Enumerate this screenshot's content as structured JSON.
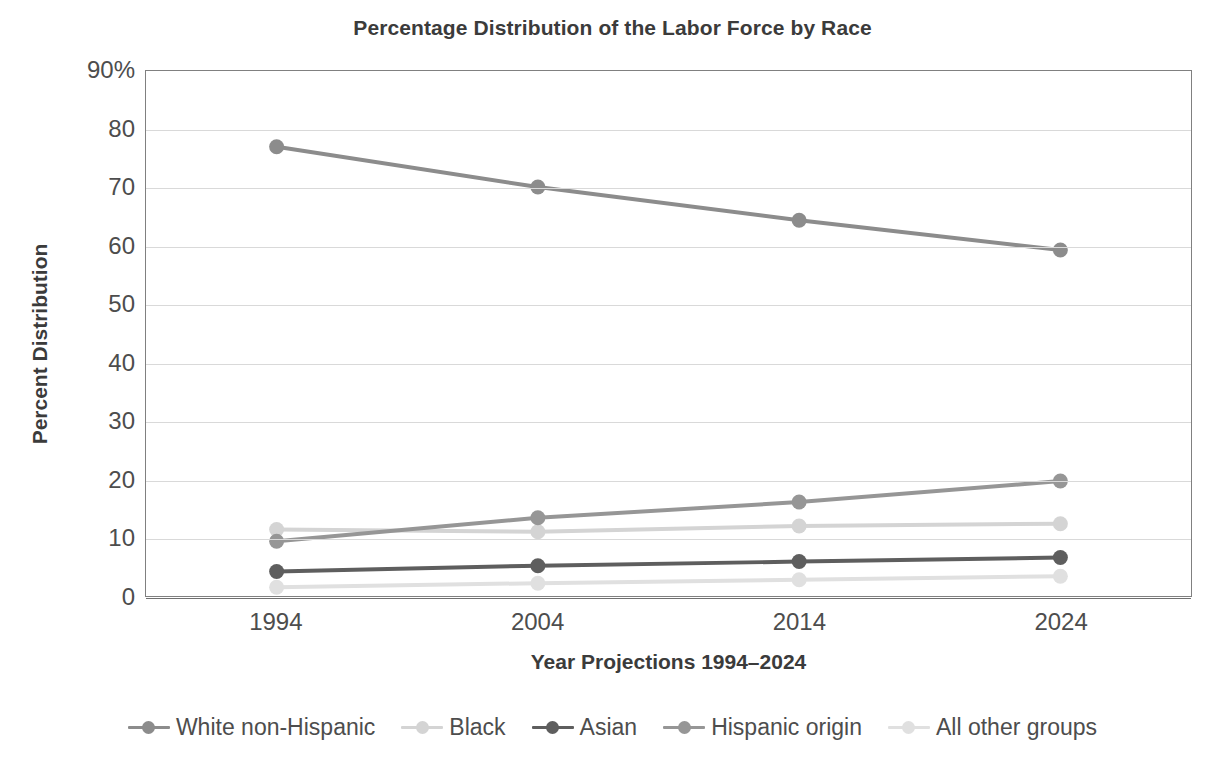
{
  "chart_data": {
    "type": "line",
    "title": "Percentage Distribution of the Labor Force by Race",
    "xlabel": "Year Projections 1994–2024",
    "ylabel": "Percent Distribution",
    "categories": [
      "1994",
      "2004",
      "2014",
      "2024"
    ],
    "x": [
      1994,
      2004,
      2014,
      2024
    ],
    "ylim": [
      0,
      90
    ],
    "ytick_labels": [
      "90%",
      "80",
      "70",
      "60",
      "50",
      "40",
      "30",
      "20",
      "10",
      "0"
    ],
    "ytick_values": [
      90,
      80,
      70,
      60,
      50,
      40,
      30,
      20,
      10,
      0
    ],
    "grid": "horizontal",
    "legend_position": "bottom",
    "series": [
      {
        "name": "White non-Hispanic",
        "color": "#8c8c8c",
        "values": [
          77.0,
          70.1,
          64.4,
          59.3
        ]
      },
      {
        "name": "Black",
        "color": "#d4d4d4",
        "values": [
          11.4,
          11.0,
          12.0,
          12.4
        ]
      },
      {
        "name": "Asian",
        "color": "#5e5e5e",
        "values": [
          4.2,
          5.2,
          5.9,
          6.6
        ]
      },
      {
        "name": "Hispanic origin",
        "color": "#969696",
        "values": [
          9.4,
          13.4,
          16.1,
          19.7
        ]
      },
      {
        "name": "All other groups",
        "color": "#e0e0e0",
        "values": [
          1.5,
          2.2,
          2.8,
          3.4
        ]
      }
    ]
  }
}
